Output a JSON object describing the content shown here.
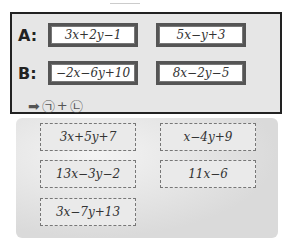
{
  "panel": {
    "rows": [
      {
        "label": "A:",
        "exprs": [
          "3x+2y−1",
          "5x−y+3"
        ]
      },
      {
        "label": "B:",
        "exprs": [
          "−2x−6y+10",
          "8x−2y−5"
        ]
      }
    ],
    "hint": {
      "arrow": "➡",
      "first": "㉠",
      "plus": "+",
      "second": "㉡"
    }
  },
  "options": [
    "3x+5y+7",
    "x−4y+9",
    "13x−3y−2",
    "11x−6",
    "3x−7y+13"
  ]
}
